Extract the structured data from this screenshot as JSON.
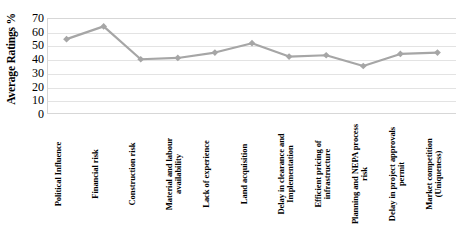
{
  "chart_data": {
    "type": "line",
    "title": "",
    "xlabel": "",
    "ylabel": "Average Ratings %",
    "ylim": [
      0,
      70
    ],
    "ytick_step": 10,
    "yticks": [
      70,
      60,
      50,
      40,
      30,
      20,
      10,
      0
    ],
    "grid": true,
    "legend": "none",
    "marker": "diamond",
    "series_color": "#a6a6a6",
    "categories": [
      "Political Influence",
      "Financial risk",
      "Construction risk",
      "Material and labour availability",
      "Lack of experience",
      "Land acquisition",
      "Delay in clearance and Implementation",
      "Efficient pricing of infrastructure",
      "Planning and NEPA process risk",
      "Delay in project approvals permit",
      "Market competition (Uniqueness)"
    ],
    "values": [
      55,
      64.5,
      40,
      41,
      45,
      52,
      42,
      43,
      35,
      44,
      45
    ]
  }
}
